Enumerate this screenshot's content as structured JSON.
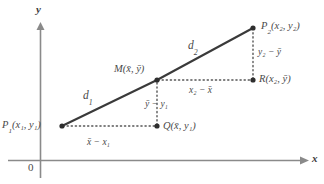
{
  "figure": {
    "type": "geometry-diagram",
    "axes": {
      "x_label": "x",
      "y_label": "y",
      "origin_label": "0",
      "x_axis_y_px": 160,
      "y_axis_x_px": 40
    },
    "points": [
      {
        "id": "P1",
        "label_prefix": "P",
        "sub": "1",
        "args": "(x₁, y₁)",
        "x": 62,
        "y": 126
      },
      {
        "id": "M",
        "label_prefix": "M",
        "sub": "",
        "args": "(x̄, ȳ)",
        "x": 157,
        "y": 80
      },
      {
        "id": "P2",
        "label_prefix": "P",
        "sub": "2",
        "args": "(x₂, y₂)",
        "x": 253,
        "y": 28
      },
      {
        "id": "Q",
        "label_prefix": "Q",
        "sub": "",
        "args": "(x̄, y₁)",
        "x": 157,
        "y": 126
      },
      {
        "id": "R",
        "label_prefix": "R",
        "sub": "",
        "args": "(x₂, ȳ)",
        "x": 253,
        "y": 80
      }
    ],
    "labels": {
      "p1": "P",
      "p1_sub": "1",
      "p1_args_open": "(x",
      "p1_args": "(x₁, y₁)",
      "p2": "P",
      "p2_sub": "2",
      "p2_args": "(x₂, y₂)",
      "m": "M",
      "m_args": "(x̄, ȳ)",
      "q": "Q",
      "q_args": "(x̄, y₁)",
      "r": "R",
      "r_args": "(x₂, ȳ)",
      "d1": "d",
      "d1_sub": "1",
      "d2": "d",
      "d2_sub": "2",
      "seg_x_lower": "x̄ − x₁",
      "seg_y_lower": "ȳ − y₁",
      "seg_x_upper": "x₂ − x̄",
      "seg_y_upper": "y₂ − ȳ"
    },
    "colors": {
      "line": "#3a3a3a",
      "axis": "#7a7a7a",
      "dotted": "#5a5a5a",
      "text": "#4a4a4a",
      "background": "#ffffff"
    }
  }
}
